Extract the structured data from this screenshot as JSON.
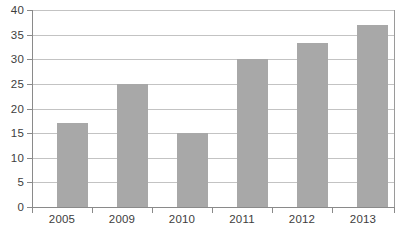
{
  "chart_data": {
    "type": "bar",
    "title": "",
    "subtitle": "",
    "xlabel": "",
    "ylabel": "",
    "categories": [
      "2005",
      "2009",
      "2010",
      "2011",
      "2012",
      "2013"
    ],
    "values": [
      17,
      25,
      15,
      30,
      33.3,
      37
    ],
    "ylim": [
      0,
      40
    ],
    "ytick_labels": [
      "0",
      "5",
      "10",
      "15",
      "20",
      "25",
      "30",
      "35",
      "40"
    ],
    "ytick_values": [
      0,
      5,
      10,
      15,
      20,
      25,
      30,
      35,
      40
    ],
    "grid": true,
    "grid_axis": "y",
    "legend": false,
    "legend_position": "none",
    "annotations": [],
    "colors": {
      "bar_fill": "#a8a8a8",
      "gridline": "#c3c3c3",
      "axis_line": "#8a8a8a",
      "tick_label_text": "#3d3d3d",
      "background": "#ffffff"
    }
  }
}
